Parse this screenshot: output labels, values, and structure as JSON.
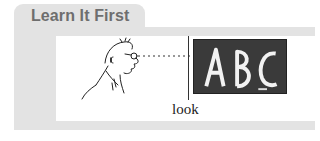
{
  "section": {
    "title": "Learn It First"
  },
  "illustration": {
    "caption": "look",
    "board_text": "ABC",
    "icons": [
      "person-looking-icon",
      "chalkboard-icon",
      "line-of-sight-dashes"
    ]
  },
  "colors": {
    "panel_bg": "#e3e3e3",
    "title_text": "#6e6e6e",
    "board_bg": "#3a3a3a"
  }
}
